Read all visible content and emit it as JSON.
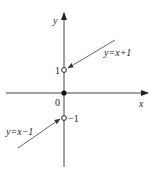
{
  "diagram": {
    "type": "piecewise-function-graph",
    "axes": {
      "x_label": "x",
      "y_label": "y",
      "origin_label": "0",
      "color": "#333333"
    },
    "points": [
      {
        "label": "1",
        "value": 1,
        "style": "open",
        "position": "left"
      },
      {
        "label": "−1",
        "value": -1,
        "style": "open",
        "position": "right"
      },
      {
        "label": "origin",
        "value": 0,
        "style": "filled"
      }
    ],
    "pointers": [
      {
        "label": "y=x+1",
        "target_point": "1",
        "direction": "upper-right"
      },
      {
        "label": "y=x−1",
        "target_point": "−1",
        "direction": "lower-left"
      }
    ],
    "labels": {
      "tick_pos1": "1",
      "tick_neg1": "−1",
      "curve_upper": "y=x+1",
      "curve_lower": "y=x−1"
    },
    "colors": {
      "line": "#333333",
      "pointer": "#555555",
      "text": "#222222",
      "background": "#ffffff"
    }
  }
}
